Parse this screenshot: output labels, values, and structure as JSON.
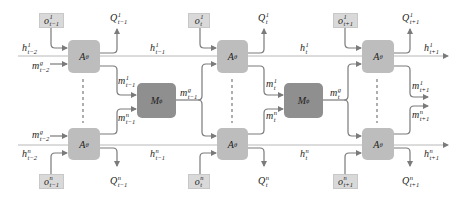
{
  "diagram": {
    "agent_label": "A",
    "agent_sub": "θ",
    "message_label": "M",
    "message_sub": "ϕ",
    "columns": [
      {
        "time": "t−1",
        "obs_top": {
          "base": "o",
          "sup": "1",
          "sub": "t−1"
        },
        "obs_bottom": {
          "base": "o",
          "sup": "n",
          "sub": "t−1"
        },
        "q_top": {
          "base": "Q",
          "sup": "1",
          "sub": "t−1"
        },
        "q_bottom": {
          "base": "Q",
          "sup": "n",
          "sub": "t−1"
        },
        "h_in_top": {
          "base": "h",
          "sup": "1",
          "sub": "t−2"
        },
        "h_in_bottom": {
          "base": "h",
          "sup": "n",
          "sub": "t−2"
        },
        "m_in_top": {
          "base": "m",
          "sup": "g",
          "sub": "t−2"
        },
        "m_in_bottom": {
          "base": "m",
          "sup": "g",
          "sub": "t−2"
        },
        "h_out_top": {
          "base": "h",
          "sup": "1",
          "sub": "t−1"
        },
        "h_out_bottom": {
          "base": "h",
          "sup": "n",
          "sub": "t−1"
        },
        "m_out_top": {
          "base": "m",
          "sup": "1",
          "sub": "t−1"
        },
        "m_out_bottom": {
          "base": "m",
          "sup": "n",
          "sub": "t−1"
        },
        "m_global": {
          "base": "m",
          "sup": "g",
          "sub": "t−1"
        }
      },
      {
        "time": "t",
        "obs_top": {
          "base": "o",
          "sup": "1",
          "sub": "t"
        },
        "obs_bottom": {
          "base": "o",
          "sup": "n",
          "sub": "t"
        },
        "q_top": {
          "base": "Q",
          "sup": "1",
          "sub": "t"
        },
        "q_bottom": {
          "base": "Q",
          "sup": "n",
          "sub": "t"
        },
        "h_out_top": {
          "base": "h",
          "sup": "1",
          "sub": "t"
        },
        "h_out_bottom": {
          "base": "h",
          "sup": "n",
          "sub": "t"
        },
        "m_out_top": {
          "base": "m",
          "sup": "1",
          "sub": "t"
        },
        "m_out_bottom": {
          "base": "m",
          "sup": "n",
          "sub": "t"
        },
        "m_global": {
          "base": "m",
          "sup": "g",
          "sub": "t"
        }
      },
      {
        "time": "t+1",
        "obs_top": {
          "base": "o",
          "sup": "1",
          "sub": "t+1"
        },
        "obs_bottom": {
          "base": "o",
          "sup": "n",
          "sub": "t+1"
        },
        "q_top": {
          "base": "Q",
          "sup": "1",
          "sub": "t+1"
        },
        "q_bottom": {
          "base": "Q",
          "sup": "n",
          "sub": "t+1"
        },
        "h_out_top": {
          "base": "h",
          "sup": "1",
          "sub": "t+1"
        },
        "h_out_bottom": {
          "base": "h",
          "sup": "n",
          "sub": "t+1"
        },
        "m_out_top": {
          "base": "m",
          "sup": "1",
          "sub": "t+1"
        },
        "m_out_bottom": {
          "base": "m",
          "sup": "n",
          "sub": "t+1"
        }
      }
    ],
    "colors": {
      "agent_box": "#bdbdbd",
      "message_box": "#8f8f8f",
      "obs_box": "#d9d9d9",
      "line": "#7a7a7a",
      "hline": "#b0b0b0"
    }
  }
}
